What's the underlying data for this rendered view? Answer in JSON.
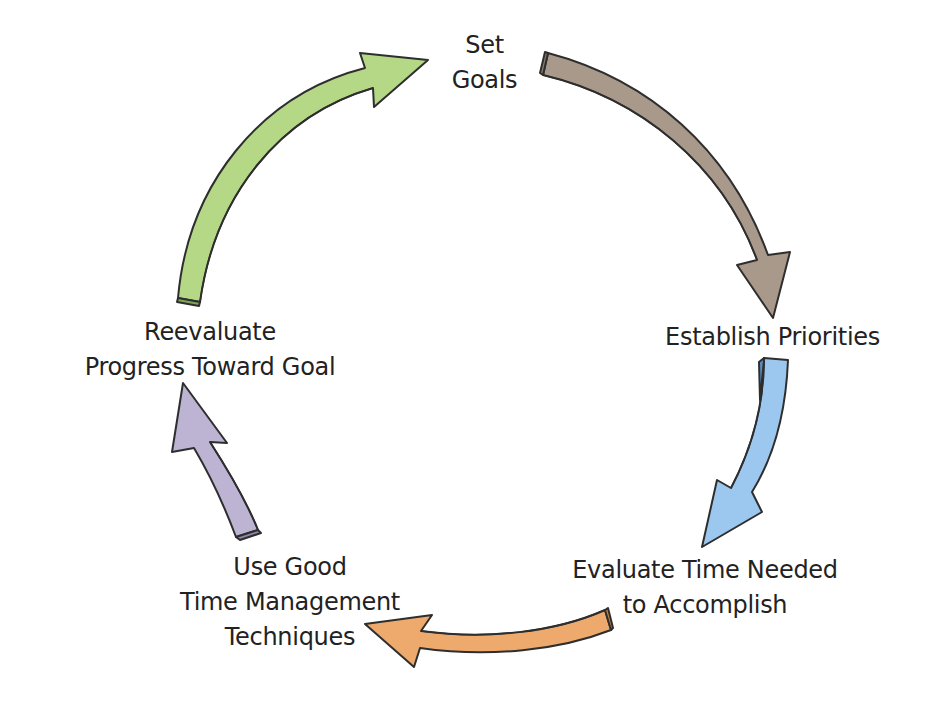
{
  "diagram": {
    "type": "cycle",
    "direction": "clockwise",
    "steps": [
      {
        "id": "set-goals",
        "lines": [
          "Set",
          "Goals"
        ]
      },
      {
        "id": "establish-priorities",
        "lines": [
          "Establish Priorities"
        ]
      },
      {
        "id": "evaluate-time",
        "lines": [
          "Evaluate Time Needed",
          "to Accomplish"
        ]
      },
      {
        "id": "use-techniques",
        "lines": [
          "Use Good",
          "Time Management",
          "Techniques"
        ]
      },
      {
        "id": "reevaluate-progress",
        "lines": [
          "Reevaluate",
          "Progress Toward Goal"
        ]
      }
    ],
    "arrows": [
      {
        "from": "set-goals",
        "to": "establish-priorities",
        "color": "#a8998a"
      },
      {
        "from": "establish-priorities",
        "to": "evaluate-time",
        "color": "#9cc8f0"
      },
      {
        "from": "evaluate-time",
        "to": "use-techniques",
        "color": "#eeaa6c"
      },
      {
        "from": "use-techniques",
        "to": "reevaluate-progress",
        "color": "#bdb4d4"
      },
      {
        "from": "reevaluate-progress",
        "to": "set-goals",
        "color": "#b5d886"
      }
    ],
    "text_color": "#222222",
    "background": "#ffffff"
  }
}
